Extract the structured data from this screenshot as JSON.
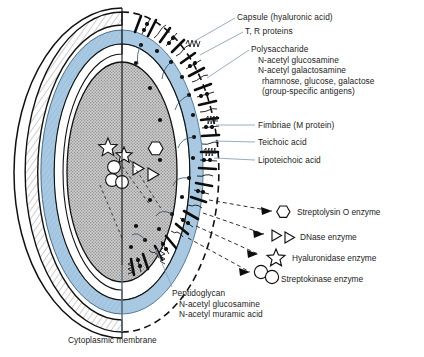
{
  "figure": {
    "colors": {
      "outline": "#111111",
      "capsule_fill": "#fdfdfd",
      "capsule_hatch": "#7c7c7c",
      "blue_layer": "#a9c9e2",
      "blue_layer_dark": "#8fb6d6",
      "cytoplasm": "#b9b9b9",
      "leader": "#8fa9c0",
      "text": "#1b1b1b"
    }
  },
  "labels": {
    "capsule": "Capsule (hyaluronic acid)",
    "tr_proteins": "T, R proteins",
    "polysaccharide_title": "Polysaccharide",
    "polysaccharide_lines": [
      "N-acetyl glucosamine",
      "N-acetyl galactosamine",
      "rhamnose, glucose, galactose",
      "(group-specific antigens)"
    ],
    "fimbriae": "Fimbriae (M protein)",
    "teichoic_acid": "Teichoic acid",
    "lipoteichoic_acid": "Lipoteichoic acid",
    "peptidoglycan_title": "Peptidoglycan",
    "peptidoglycan_lines": [
      "N-acetyl glucosamine",
      "N-acetyl muramic acid"
    ],
    "cytoplasmic_membrane": "Cytoplasmic membrane"
  },
  "legend": {
    "items": [
      {
        "icon": "hexagon-icon",
        "label": "Streptolysin O enzyme"
      },
      {
        "icon": "double-triangle-icon",
        "label": "DNase enzyme"
      },
      {
        "icon": "star-icon",
        "label": "Hyaluronidase enzyme"
      },
      {
        "icon": "double-circle-icon",
        "label": "Streptokinase enzyme"
      }
    ]
  }
}
